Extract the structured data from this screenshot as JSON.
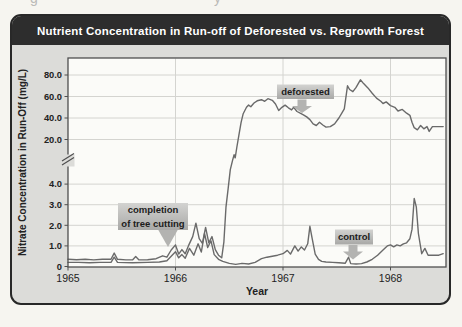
{
  "header": {
    "title": "Nutrient Concentration in Run-off of Deforested vs. Regrowth Forest"
  },
  "page_fragments": [
    {
      "char": "g"
    },
    {
      "char": "y"
    }
  ],
  "colors": {
    "title_bar": "#2d2d2d",
    "title_text": "#ffffff",
    "card_bg": "#dcdcd9",
    "plot_bg": "#fbfbf8",
    "plot_border": "#4f4f4f",
    "gridline": "#d4d4d0",
    "curve": "#6a6a6a",
    "axis_text": "#222222",
    "annotation_box_top": "#d3d3d1",
    "annotation_box_bottom": "#a8a8a6",
    "annotation_text": "#1c1c1c",
    "arrow_fill": "#b3b3b1"
  },
  "chart_data": {
    "type": "line",
    "title": "Nutrient Concentration in Run-off of Deforested vs. Regrowth Forest",
    "xlabel": "Year",
    "ylabel": "Nitrate Concentration in Run-Off (mg/L)",
    "x_ticks": [
      {
        "v": 1965,
        "label": "1965"
      },
      {
        "v": 1966,
        "label": "1966"
      },
      {
        "v": 1967,
        "label": "1967"
      },
      {
        "v": 1968,
        "label": "1968"
      }
    ],
    "y_ticks": [
      {
        "v": 80,
        "label": "80.0"
      },
      {
        "v": 60,
        "label": "60.0"
      },
      {
        "v": 40,
        "label": "40.0"
      },
      {
        "v": 20,
        "label": "20.0"
      },
      {
        "v": 4,
        "label": "4.0"
      },
      {
        "v": 3,
        "label": "3.0"
      },
      {
        "v": 2,
        "label": "2.0"
      },
      {
        "v": 1,
        "label": "1.0"
      },
      {
        "v": 0,
        "label": "0"
      }
    ],
    "y_gridlines": [
      80,
      60,
      40,
      20,
      4,
      3,
      2,
      1
    ],
    "x_gridlines": [
      1966,
      1967,
      1968
    ],
    "axis_break": {
      "lower_max": 5,
      "upper_min": 20,
      "note": "scale break between 4.0 and 20.0 mg/L"
    },
    "x_range": [
      1965,
      1968.49
    ],
    "grid": true,
    "legend": "inline annotations",
    "series": [
      {
        "name": "deforested",
        "points": [
          [
            1965.0,
            0.35
          ],
          [
            1965.08,
            0.33
          ],
          [
            1965.16,
            0.35
          ],
          [
            1965.24,
            0.32
          ],
          [
            1965.32,
            0.35
          ],
          [
            1965.4,
            0.35
          ],
          [
            1965.43,
            0.65
          ],
          [
            1965.46,
            0.35
          ],
          [
            1965.54,
            0.32
          ],
          [
            1965.6,
            0.32
          ],
          [
            1965.63,
            0.48
          ],
          [
            1965.66,
            0.32
          ],
          [
            1965.74,
            0.33
          ],
          [
            1965.82,
            0.38
          ],
          [
            1965.88,
            0.52
          ],
          [
            1965.92,
            0.45
          ],
          [
            1965.96,
            0.8
          ],
          [
            1966.0,
            1.05
          ],
          [
            1966.03,
            0.6
          ],
          [
            1966.06,
            0.82
          ],
          [
            1966.09,
            0.62
          ],
          [
            1966.12,
            1.0
          ],
          [
            1966.16,
            1.45
          ],
          [
            1966.19,
            2.1
          ],
          [
            1966.22,
            1.35
          ],
          [
            1966.25,
            1.12
          ],
          [
            1966.28,
            1.9
          ],
          [
            1966.31,
            1.15
          ],
          [
            1966.34,
            1.45
          ],
          [
            1966.37,
            0.82
          ],
          [
            1966.4,
            0.55
          ],
          [
            1966.43,
            0.42
          ],
          [
            1966.45,
            1.2
          ],
          [
            1966.47,
            2.9
          ],
          [
            1966.49,
            3.8
          ],
          [
            1966.51,
            4.7
          ],
          [
            1966.53,
            6.8
          ],
          [
            1966.545,
            10.5
          ],
          [
            1966.555,
            8.5
          ],
          [
            1966.57,
            15.0
          ],
          [
            1966.59,
            24.0
          ],
          [
            1966.61,
            36.0
          ],
          [
            1966.63,
            44.0
          ],
          [
            1966.66,
            50.0
          ],
          [
            1966.68,
            52.0
          ],
          [
            1966.7,
            50.5
          ],
          [
            1966.73,
            54.0
          ],
          [
            1966.76,
            56.0
          ],
          [
            1966.8,
            57.0
          ],
          [
            1966.83,
            55.5
          ],
          [
            1966.86,
            58.0
          ],
          [
            1966.9,
            56.5
          ],
          [
            1966.93,
            53.0
          ],
          [
            1966.96,
            47.0
          ],
          [
            1966.99,
            50.0
          ],
          [
            1967.02,
            52.0
          ],
          [
            1967.05,
            49.5
          ],
          [
            1967.08,
            47.5
          ],
          [
            1967.1,
            50.0
          ],
          [
            1967.13,
            46.0
          ],
          [
            1967.16,
            44.5
          ],
          [
            1967.19,
            43.0
          ],
          [
            1967.22,
            41.0
          ],
          [
            1967.25,
            38.5
          ],
          [
            1967.28,
            34.5
          ],
          [
            1967.31,
            33.0
          ],
          [
            1967.34,
            36.0
          ],
          [
            1967.37,
            33.5
          ],
          [
            1967.4,
            31.5
          ],
          [
            1967.44,
            32.0
          ],
          [
            1967.48,
            34.5
          ],
          [
            1967.52,
            40.0
          ],
          [
            1967.55,
            45.0
          ],
          [
            1967.57,
            48.5
          ],
          [
            1967.6,
            70.0
          ],
          [
            1967.62,
            66.5
          ],
          [
            1967.65,
            64.5
          ],
          [
            1967.68,
            68.5
          ],
          [
            1967.72,
            75.5
          ],
          [
            1967.75,
            72.0
          ],
          [
            1967.79,
            68.0
          ],
          [
            1967.83,
            63.0
          ],
          [
            1967.87,
            58.5
          ],
          [
            1967.91,
            55.5
          ],
          [
            1967.93,
            53.5
          ],
          [
            1967.96,
            55.0
          ],
          [
            1968.0,
            51.5
          ],
          [
            1968.04,
            50.0
          ],
          [
            1968.07,
            46.5
          ],
          [
            1968.11,
            48.0
          ],
          [
            1968.15,
            44.5
          ],
          [
            1968.18,
            42.5
          ],
          [
            1968.2,
            36.0
          ],
          [
            1968.22,
            31.0
          ],
          [
            1968.25,
            29.0
          ],
          [
            1968.28,
            33.0
          ],
          [
            1968.31,
            30.0
          ],
          [
            1968.34,
            32.0
          ],
          [
            1968.36,
            27.5
          ],
          [
            1968.39,
            32.0
          ],
          [
            1968.44,
            32.0
          ],
          [
            1968.49,
            32.0
          ]
        ]
      },
      {
        "name": "control",
        "points": [
          [
            1965.0,
            0.2
          ],
          [
            1965.1,
            0.2
          ],
          [
            1965.2,
            0.18
          ],
          [
            1965.3,
            0.2
          ],
          [
            1965.4,
            0.2
          ],
          [
            1965.43,
            0.45
          ],
          [
            1965.46,
            0.2
          ],
          [
            1965.6,
            0.18
          ],
          [
            1965.74,
            0.2
          ],
          [
            1965.85,
            0.22
          ],
          [
            1965.92,
            0.28
          ],
          [
            1965.96,
            0.5
          ],
          [
            1966.0,
            0.72
          ],
          [
            1966.03,
            0.42
          ],
          [
            1966.06,
            0.58
          ],
          [
            1966.09,
            0.4
          ],
          [
            1966.13,
            0.88
          ],
          [
            1966.17,
            0.55
          ],
          [
            1966.21,
            1.1
          ],
          [
            1966.24,
            0.7
          ],
          [
            1966.27,
            1.6
          ],
          [
            1966.3,
            0.92
          ],
          [
            1966.33,
            1.25
          ],
          [
            1966.36,
            0.58
          ],
          [
            1966.4,
            0.35
          ],
          [
            1966.44,
            0.25
          ],
          [
            1966.5,
            0.15
          ],
          [
            1966.56,
            0.1
          ],
          [
            1966.62,
            0.15
          ],
          [
            1966.68,
            0.12
          ],
          [
            1966.74,
            0.2
          ],
          [
            1966.8,
            0.38
          ],
          [
            1966.85,
            0.45
          ],
          [
            1966.9,
            0.5
          ],
          [
            1966.95,
            0.55
          ],
          [
            1967.0,
            0.62
          ],
          [
            1967.04,
            0.78
          ],
          [
            1967.07,
            0.6
          ],
          [
            1967.11,
            1.0
          ],
          [
            1967.14,
            0.75
          ],
          [
            1967.17,
            0.95
          ],
          [
            1967.2,
            0.8
          ],
          [
            1967.23,
            1.1
          ],
          [
            1967.25,
            1.95
          ],
          [
            1967.27,
            1.4
          ],
          [
            1967.3,
            0.6
          ],
          [
            1967.33,
            0.35
          ],
          [
            1967.36,
            0.25
          ],
          [
            1967.4,
            0.22
          ],
          [
            1967.46,
            0.2
          ],
          [
            1967.52,
            0.18
          ],
          [
            1967.58,
            0.16
          ],
          [
            1967.61,
            0.45
          ],
          [
            1967.63,
            0.14
          ],
          [
            1967.68,
            0.12
          ],
          [
            1967.73,
            0.14
          ],
          [
            1967.78,
            0.22
          ],
          [
            1967.83,
            0.35
          ],
          [
            1967.88,
            0.55
          ],
          [
            1967.93,
            0.8
          ],
          [
            1967.97,
            1.0
          ],
          [
            1968.0,
            1.05
          ],
          [
            1968.03,
            0.95
          ],
          [
            1968.06,
            1.05
          ],
          [
            1968.09,
            1.0
          ],
          [
            1968.12,
            1.1
          ],
          [
            1968.15,
            1.15
          ],
          [
            1968.18,
            1.35
          ],
          [
            1968.2,
            1.8
          ],
          [
            1968.22,
            3.3
          ],
          [
            1968.24,
            2.9
          ],
          [
            1968.26,
            1.6
          ],
          [
            1968.29,
            0.62
          ],
          [
            1968.32,
            0.88
          ],
          [
            1968.35,
            0.55
          ],
          [
            1968.4,
            0.55
          ],
          [
            1968.45,
            0.55
          ],
          [
            1968.49,
            0.62
          ]
        ]
      }
    ],
    "annotations": [
      {
        "name": "completion-of-tree-cutting",
        "lines": [
          "completion",
          "of tree cutting"
        ],
        "box": {
          "x": 118,
          "y": 203,
          "w": 70,
          "h": 27
        },
        "arrow": {
          "cx": 168,
          "y0": 229.5,
          "y1": 229.5,
          "tip": 247,
          "stem_hw": 10,
          "head_hw": 10
        }
      },
      {
        "name": "deforested",
        "lines": [
          "deforested"
        ],
        "box": {
          "x": 277,
          "y": 84.5,
          "w": 57,
          "h": 14.5
        },
        "arrow": {
          "cx": 302,
          "y0": 99.5,
          "y1": 106,
          "tip": 113,
          "stem_hw": 4.5,
          "head_hw": 10
        }
      },
      {
        "name": "control",
        "lines": [
          "control"
        ],
        "box": {
          "x": 335,
          "y": 229.5,
          "w": 38,
          "h": 15
        },
        "arrow": {
          "cx": 353,
          "y0": 245,
          "y1": 251.5,
          "tip": 259.5,
          "stem_hw": 4.5,
          "head_hw": 10
        }
      }
    ]
  }
}
